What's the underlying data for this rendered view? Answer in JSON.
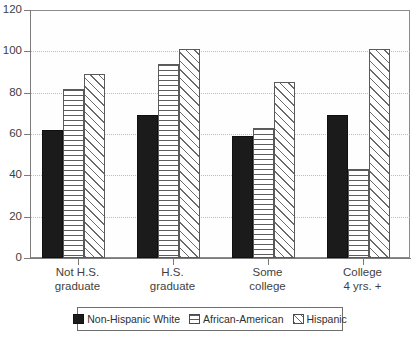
{
  "chart_data": {
    "type": "bar",
    "title": "",
    "subtitle": "",
    "xlabel": "",
    "ylabel": "",
    "ylim": [
      0,
      120
    ],
    "yticks": [
      0,
      20,
      40,
      60,
      80,
      100,
      120
    ],
    "grid": true,
    "legend_position": "bottom",
    "categories": [
      "Not H.S. graduate",
      "H.S. graduate",
      "Some college",
      "College 4 yrs. +"
    ],
    "category_label_lines": [
      [
        "Not H.S.",
        "graduate"
      ],
      [
        "H.S.",
        "graduate"
      ],
      [
        "Some",
        "college"
      ],
      [
        "College",
        "4 yrs. +"
      ]
    ],
    "series": [
      {
        "name": "Non-Hispanic White",
        "key": "white-series",
        "fill": "solid-black",
        "color": "#1b1b1b",
        "values": [
          62,
          69,
          59,
          69
        ]
      },
      {
        "name": "African-American",
        "key": "aa-series",
        "fill": "horizontal-hatch",
        "color": "#5d5d5d",
        "values": [
          82,
          94,
          63,
          43
        ]
      },
      {
        "name": "Hispanic",
        "key": "hisp-series",
        "fill": "diagonal-hatch",
        "color": "#6a6a6a",
        "values": [
          89,
          101,
          85,
          101
        ]
      }
    ]
  },
  "axis": {
    "y_tick_labels": [
      "120",
      "100",
      "80",
      "60",
      "40",
      "20",
      "0"
    ]
  },
  "legend": {
    "entries": [
      {
        "label": "Non-Hispanic White",
        "key": "white-series"
      },
      {
        "label": "African-American",
        "key": "aa-series"
      },
      {
        "label": "Hispanic",
        "key": "hisp-series"
      }
    ]
  }
}
